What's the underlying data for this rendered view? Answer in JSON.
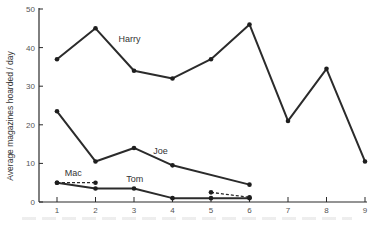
{
  "chart_data": {
    "type": "line",
    "title": "",
    "xlabel": "",
    "ylabel": "Average magazines hoarded / day",
    "xlim": [
      1,
      9
    ],
    "ylim": [
      0,
      50
    ],
    "x_ticks": [
      1,
      2,
      3,
      4,
      5,
      6,
      7,
      8,
      9
    ],
    "y_ticks": [
      0,
      10,
      20,
      30,
      40,
      50
    ],
    "grid": false,
    "legend": "inline labels",
    "series": [
      {
        "name": "Harry",
        "style": "solid",
        "x": [
          1,
          2,
          3,
          4,
          5,
          6,
          7,
          8,
          9
        ],
        "values": [
          37,
          45,
          34,
          32,
          37,
          46,
          21,
          34.5,
          10.5
        ],
        "label_pos": {
          "x": 2.6,
          "y": 41.5
        }
      },
      {
        "name": "Joe",
        "style": "solid",
        "x": [
          1,
          2,
          3,
          4,
          6
        ],
        "values": [
          23.5,
          10.5,
          14,
          9.5,
          4.5
        ],
        "label_pos": {
          "x": 3.5,
          "y": 12.5
        }
      },
      {
        "name": "Tom",
        "style": "solid",
        "x": [
          1,
          2,
          3,
          4,
          5,
          6
        ],
        "values": [
          5,
          3.5,
          3.5,
          1,
          1,
          1
        ],
        "label_pos": {
          "x": 2.8,
          "y": 5.3
        }
      },
      {
        "name": "Mac",
        "style": "dashed",
        "segments": [
          {
            "x": [
              1,
              2
            ],
            "values": [
              5,
              5
            ]
          },
          {
            "x": [
              5,
              6
            ],
            "values": [
              2.5,
              1.2
            ]
          }
        ],
        "label_pos": {
          "x": 1.2,
          "y": 6.8
        }
      }
    ]
  },
  "axes": {
    "ylabel": "Average magazines hoarded / day"
  }
}
